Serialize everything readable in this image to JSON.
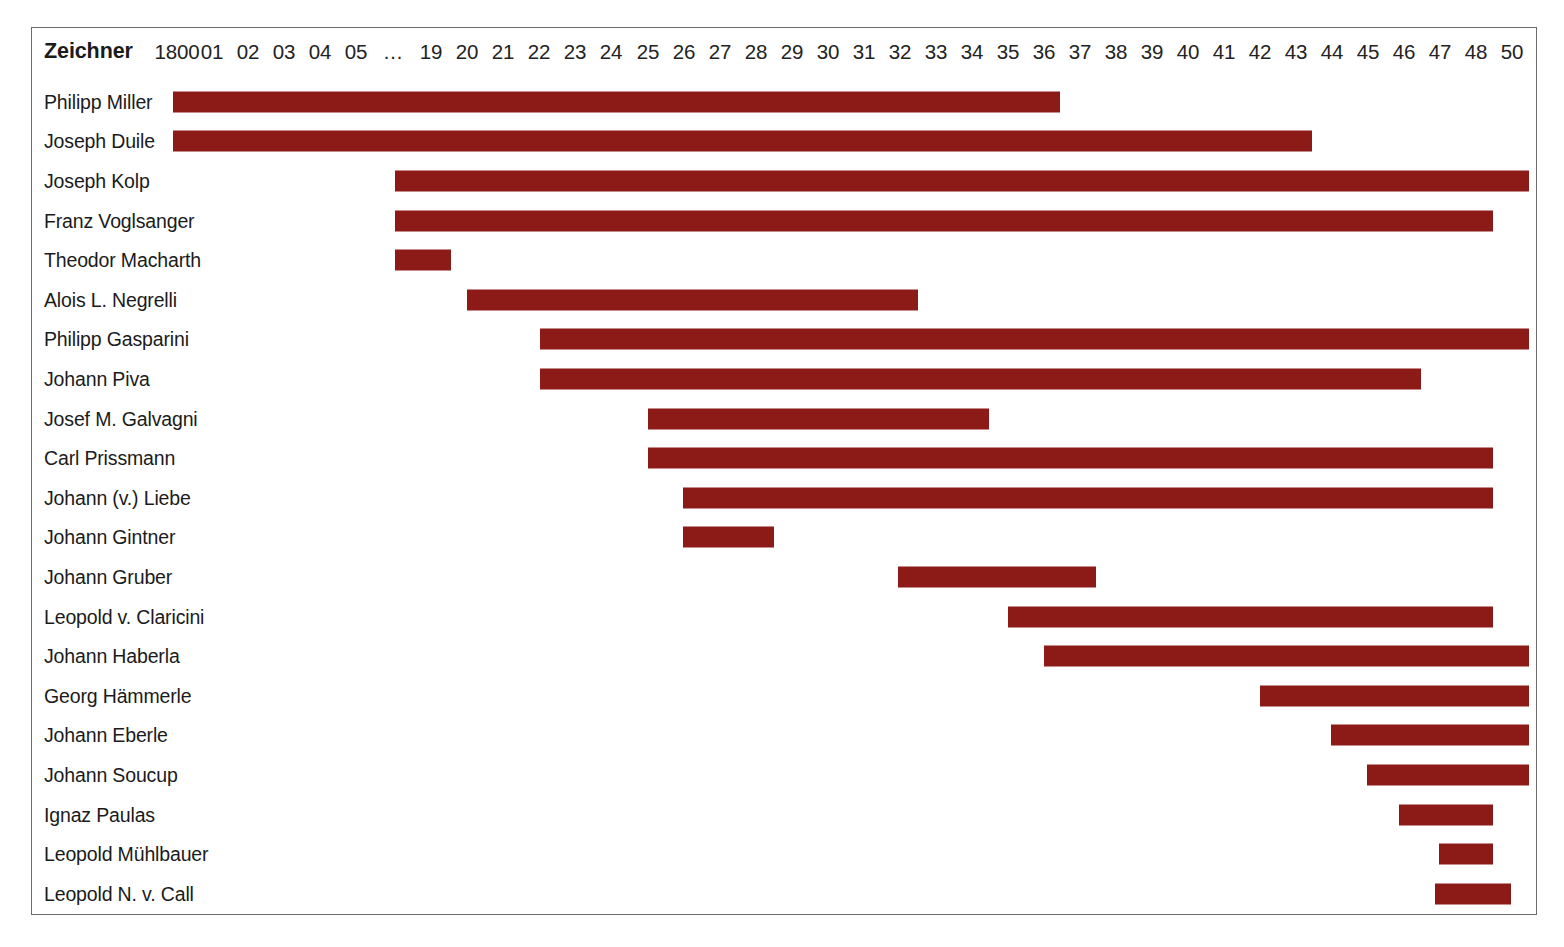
{
  "header": {
    "row_header_label": "Zeichner",
    "years": [
      "1800",
      "01",
      "02",
      "03",
      "04",
      "05",
      "…",
      "19",
      "20",
      "21",
      "22",
      "23",
      "24",
      "25",
      "26",
      "27",
      "28",
      "29",
      "30",
      "31",
      "32",
      "33",
      "34",
      "35",
      "36",
      "37",
      "38",
      "39",
      "40",
      "41",
      "42",
      "43",
      "44",
      "45",
      "46",
      "47",
      "48",
      "50"
    ]
  },
  "colors": {
    "bar": "#8c1b18",
    "frame": "#6b6b6b",
    "text": "#1b1b1b",
    "background": "#ffffff"
  },
  "chart_data": {
    "type": "bar",
    "title": "",
    "xlabel": "",
    "ylabel": "Zeichner",
    "orientation": "horizontal-gantt",
    "grid": false,
    "legend": "none",
    "x_tick_labels": [
      "1800",
      "01",
      "02",
      "03",
      "04",
      "05",
      "…",
      "19",
      "20",
      "21",
      "22",
      "23",
      "24",
      "25",
      "26",
      "27",
      "28",
      "29",
      "30",
      "31",
      "32",
      "33",
      "34",
      "35",
      "36",
      "37",
      "38",
      "39",
      "40",
      "41",
      "42",
      "43",
      "44",
      "45",
      "46",
      "47",
      "48",
      "50"
    ],
    "categories": [
      "Philipp Miller",
      "Joseph Duile",
      "Joseph Kolp",
      "Franz Voglsanger",
      "Theodor Macharth",
      "Alois L. Negrelli",
      "Philipp Gasparini",
      "Johann Piva",
      "Josef M. Galvagni",
      "Carl Prissmann",
      "Johann (v.) Liebe",
      "Johann Gintner",
      "Johann Gruber",
      "Leopold v. Claricini",
      "Johann Haberla",
      "Georg Hämmerle",
      "Johann Eberle",
      "Johann Soucup",
      "Ignaz Paulas",
      "Leopold Mühlbauer",
      "Leopold N. v. Call"
    ],
    "bars": [
      {
        "name": "Philipp Miller",
        "start_label": "1800",
        "end_label": "36",
        "start_px": 172,
        "end_px": 1059
      },
      {
        "name": "Joseph Duile",
        "start_label": "1800",
        "end_label": "43",
        "start_px": 172,
        "end_px": 1311
      },
      {
        "name": "Joseph Kolp",
        "start_label": "…",
        "end_label": "50",
        "start_px": 394,
        "end_px": 1528
      },
      {
        "name": "Franz Voglsanger",
        "start_label": "…",
        "end_label": "48",
        "start_px": 394,
        "end_px": 1492
      },
      {
        "name": "Theodor Macharth",
        "start_label": "…",
        "end_label": "19",
        "start_px": 394,
        "end_px": 450
      },
      {
        "name": "Alois L. Negrelli",
        "start_label": "20",
        "end_label": "32",
        "start_px": 466,
        "end_px": 917
      },
      {
        "name": "Philipp Gasparini",
        "start_label": "22",
        "end_label": "50",
        "start_px": 539,
        "end_px": 1528
      },
      {
        "name": "Johann Piva",
        "start_label": "22",
        "end_label": "46",
        "start_px": 539,
        "end_px": 1420
      },
      {
        "name": "Josef M. Galvagni",
        "start_label": "25",
        "end_label": "34",
        "start_px": 647,
        "end_px": 988
      },
      {
        "name": "Carl Prissmann",
        "start_label": "25",
        "end_label": "48",
        "start_px": 647,
        "end_px": 1492
      },
      {
        "name": "Johann (v.) Liebe",
        "start_label": "26",
        "end_label": "48",
        "start_px": 682,
        "end_px": 1492
      },
      {
        "name": "Johann Gintner",
        "start_label": "26",
        "end_label": "28",
        "start_px": 682,
        "end_px": 773
      },
      {
        "name": "Johann Gruber",
        "start_label": "32",
        "end_label": "37",
        "start_px": 897,
        "end_px": 1095
      },
      {
        "name": "Leopold v. Claricini",
        "start_label": "35",
        "end_label": "50",
        "start_px": 1007,
        "end_px": 1492
      },
      {
        "name": "Johann Haberla",
        "start_label": "36",
        "end_label": "50",
        "start_px": 1043,
        "end_px": 1528
      },
      {
        "name": "Georg Hämmerle",
        "start_label": "42",
        "end_label": "50",
        "start_px": 1259,
        "end_px": 1528
      },
      {
        "name": "Johann Eberle",
        "start_label": "44",
        "end_label": "50",
        "start_px": 1330,
        "end_px": 1528
      },
      {
        "name": "Johann Soucup",
        "start_label": "45",
        "end_label": "50",
        "start_px": 1366,
        "end_px": 1528
      },
      {
        "name": "Ignaz Paulas",
        "start_label": "46",
        "end_label": "48",
        "start_px": 1398,
        "end_px": 1492
      },
      {
        "name": "Leopold Mühlbauer",
        "start_label": "47",
        "end_label": "48",
        "start_px": 1438,
        "end_px": 1492
      },
      {
        "name": "Leopold N. v. Call",
        "start_label": "47",
        "end_label": "50",
        "start_px": 1434,
        "end_px": 1510
      }
    ]
  }
}
